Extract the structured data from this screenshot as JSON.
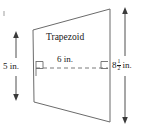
{
  "figure": {
    "type": "geometry-diagram",
    "shape": "trapezoid",
    "shape_label": "Trapezoid",
    "stroke_color": "#6b6b6b",
    "dash_color": "#6b6b6b",
    "text_color": "#1a1a1a",
    "background": "#ffffff",
    "labels": {
      "shape_name": "Trapezoid",
      "midsegment": "6 in.",
      "left_height": "5 in.",
      "right_height_whole": "8",
      "right_height_numerator": "1",
      "right_height_denominator": "2",
      "right_height_unit": "in."
    },
    "measurements": [
      {
        "name": "midsegment",
        "value": 6,
        "unit": "in.",
        "display": "6 in."
      },
      {
        "name": "left-side-height",
        "value": 5,
        "unit": "in.",
        "display": "5 in."
      },
      {
        "name": "right-side-height",
        "value": 8.5,
        "unit": "in.",
        "display": "8 1/2 in."
      }
    ],
    "vertices": {
      "top_left": [
        33,
        30
      ],
      "top_right": [
        110,
        9
      ],
      "bottom_right": [
        110,
        122
      ],
      "bottom_left": [
        34,
        102
      ]
    },
    "midsegment_line": {
      "x1": 36,
      "y1": 68,
      "x2": 108,
      "y2": 68,
      "style": "dashed"
    },
    "right_angle_markers": [
      {
        "at": [
          36,
          68
        ],
        "side": "left"
      },
      {
        "at": [
          108,
          68
        ],
        "side": "right"
      }
    ],
    "dimension_arrows": [
      {
        "name": "left-height-arrow",
        "x": 16,
        "y1": 32,
        "y2": 100,
        "heads": "both"
      },
      {
        "name": "right-height-arrow",
        "x": 125,
        "y1": 8,
        "y2": 123,
        "heads": "both"
      }
    ]
  }
}
